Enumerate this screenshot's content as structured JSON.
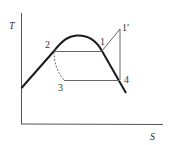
{
  "diagram": {
    "type": "T-S diagram",
    "axes": {
      "y_label": "T",
      "x_label": "S"
    },
    "points": {
      "p1": "1",
      "p1prime": "1′",
      "p2": "2",
      "p3": "3",
      "p4": "4"
    },
    "colors": {
      "dome": "#1a1a1a",
      "lines": "#555555",
      "axes": "#555555",
      "text": "#333333"
    }
  }
}
